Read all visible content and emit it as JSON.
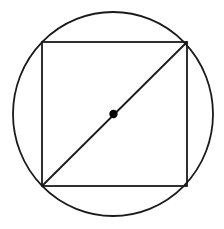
{
  "figure": {
    "background_color": "#ffffff",
    "stroke_color": "#1a1a1a",
    "dot_color": "#000000",
    "canvas": {
      "width": 224,
      "height": 229
    },
    "elements": {
      "circle": {
        "name": "circumscribed circle",
        "center_x": 113,
        "center_y": 114,
        "radius_x": 100,
        "radius_y": 102,
        "stroke_width": 1.8
      },
      "square": {
        "name": "inscribed square",
        "left": 42,
        "top": 42,
        "right": 187,
        "bottom": 186,
        "width": 145,
        "height": 144,
        "stroke_width": 1.8
      },
      "diagonal": {
        "name": "square diagonal / circle diameter",
        "x1": 42,
        "y1": 186,
        "x2": 187,
        "y2": 42,
        "stroke_width": 1.8
      },
      "center_dot": {
        "name": "center point marker",
        "cx": 113.5,
        "cy": 114,
        "radius": 4.2
      }
    }
  }
}
